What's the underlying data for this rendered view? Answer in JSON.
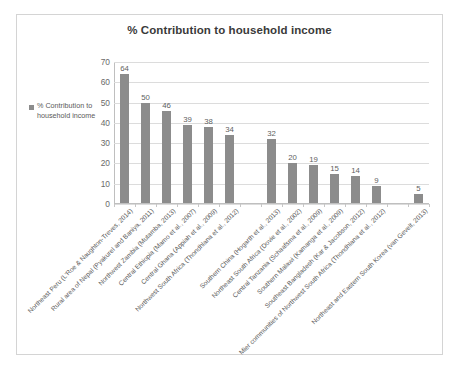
{
  "frame": {
    "border_color": "#d4d4d4"
  },
  "chart_data": {
    "type": "bar",
    "title": "% Contribution to household income",
    "xlabel": "",
    "ylabel": "",
    "ylim": [
      0,
      70
    ],
    "ytick_step": 10,
    "yticks": [
      70,
      60,
      50,
      40,
      30,
      20,
      10,
      0
    ],
    "grid": true,
    "legend_position": "left",
    "legend": [
      "% Contribution to household income"
    ],
    "bar_color": "#8c8c8c",
    "categories": [
      "Northeast Peru (L'Roe & Naughton-Treves, 2014)",
      "Rural area of Nepal (Pyakurel and Baniya, 2011)",
      "Northwest Zambia (Mutamba, 2013)",
      "Central Ethiopia (Mamo et al., 2007)",
      "Central Ghana (Appiah et al., 2009)",
      "Northwest South Africa (Thondhlana et al., 2012)",
      "",
      "Southern China (Hogarth et al., 2013)",
      "Northeast South Africa (Dovie et al., 2002)",
      "Central Tanzania (Schaafsma et al., 2009)",
      "Southern Malawi (Kamanga et al., 2009)",
      "Southeast Bangladesh (Kar & Jacobson, 2012)",
      "Mier communities of Northwest South Africa (Thondhlana et al., 2012)",
      "",
      "Northeast and Eastern South Korea (van Gevelt, 2013)"
    ],
    "values": [
      64,
      50,
      46,
      39,
      38,
      34,
      null,
      32,
      20,
      19,
      15,
      14,
      9,
      null,
      5
    ],
    "value_labels": [
      "64",
      "50",
      "46",
      "39",
      "38",
      "34",
      "",
      "32",
      "20",
      "19",
      "15",
      "14",
      "9",
      "",
      "5"
    ]
  }
}
